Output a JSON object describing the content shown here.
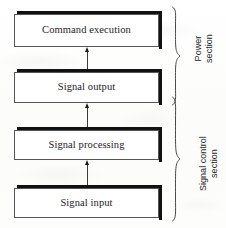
{
  "diagram": {
    "colors": {
      "box_border": "#55565a",
      "box_shadow": "#111111",
      "arrow": "#1a1a1a",
      "brace": "#4a4a4a",
      "background": "#fdfdfc",
      "text": "#1d1d1d"
    },
    "blocks": [
      {
        "id": "command-execution",
        "label": "Command execution"
      },
      {
        "id": "signal-output",
        "label": "Signal output"
      },
      {
        "id": "signal-processing",
        "label": "Signal processing"
      },
      {
        "id": "signal-input",
        "label": "Signal input"
      }
    ],
    "arrows": [
      {
        "id": "arrow-output-to-command",
        "from": "Signal output",
        "to": "Command execution",
        "direction": "up"
      },
      {
        "id": "arrow-processing-to-output",
        "from": "Signal processing",
        "to": "Signal output",
        "direction": "up"
      },
      {
        "id": "arrow-input-to-processing",
        "from": "Signal input",
        "to": "Signal processing",
        "direction": "up"
      }
    ],
    "groups": [
      {
        "id": "power-section",
        "label_lines": [
          "Power",
          "section"
        ],
        "covers": [
          "Command execution",
          "Signal output"
        ]
      },
      {
        "id": "signal-control-section",
        "label_lines": [
          "Signal control",
          "section"
        ],
        "covers": [
          "Signal output",
          "Signal processing",
          "Signal input"
        ]
      }
    ]
  }
}
